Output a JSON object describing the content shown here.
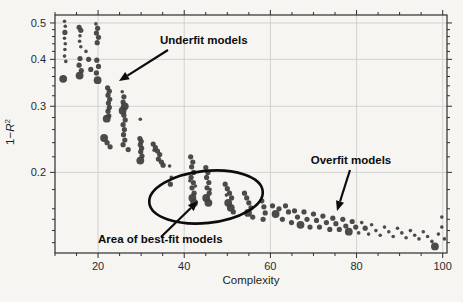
{
  "figure": {
    "bg_color": "#f6f5f2",
    "point_color": "#414140",
    "grid_color": "#c9c9c7",
    "frame_color": "#2e2e2e",
    "annotation_color": "#0c0c0c"
  },
  "chart_data": {
    "type": "scatter",
    "title": "",
    "xlabel": "Complexity",
    "ylabel": "1−R²",
    "ylabel_parts": {
      "prefix": "1−",
      "variable": "R",
      "superscript": "2"
    },
    "y_scale": "log",
    "grid": true,
    "xlim": [
      10,
      101
    ],
    "ylim": [
      0.122,
      0.525
    ],
    "x_ticks": [
      20,
      40,
      60,
      80,
      100
    ],
    "x_tick_labels": [
      "20",
      "40",
      "60",
      "80",
      "100"
    ],
    "x_minor_step": 5,
    "y_ticks": [
      0.5,
      0.4,
      0.3,
      0.2
    ],
    "y_tick_labels": [
      "0.5",
      "0.4",
      "0.3",
      "0.2"
    ],
    "y_minor_ticks": [
      0.48,
      0.46,
      0.44,
      0.42,
      0.38,
      0.36,
      0.34,
      0.32,
      0.28,
      0.26,
      0.24,
      0.22,
      0.18,
      0.16,
      0.15,
      0.14,
      0.13
    ],
    "points": [
      [
        12.2,
        0.505,
        "s"
      ],
      [
        12.4,
        0.49,
        "s"
      ],
      [
        12.3,
        0.472,
        "m"
      ],
      [
        12.2,
        0.455,
        "s"
      ],
      [
        12.4,
        0.44,
        "s"
      ],
      [
        12.3,
        0.425,
        "s"
      ],
      [
        12.2,
        0.408,
        "s"
      ],
      [
        12.5,
        0.395,
        "s"
      ],
      [
        11.9,
        0.355,
        "l"
      ],
      [
        15.6,
        0.487,
        "m"
      ],
      [
        16.0,
        0.478,
        "m"
      ],
      [
        15.8,
        0.462,
        "s"
      ],
      [
        15.7,
        0.447,
        "s"
      ],
      [
        16.0,
        0.432,
        "s"
      ],
      [
        15.8,
        0.402,
        "m"
      ],
      [
        15.6,
        0.386,
        "m"
      ],
      [
        16.1,
        0.373,
        "m"
      ],
      [
        15.7,
        0.362,
        "l"
      ],
      [
        17.2,
        0.42,
        "s"
      ],
      [
        17.8,
        0.4,
        "m"
      ],
      [
        18.3,
        0.376,
        "m"
      ],
      [
        19.5,
        0.497,
        "s"
      ],
      [
        19.9,
        0.484,
        "m"
      ],
      [
        19.6,
        0.47,
        "m"
      ],
      [
        20.1,
        0.458,
        "m"
      ],
      [
        19.8,
        0.443,
        "m"
      ],
      [
        19.7,
        0.398,
        "m"
      ],
      [
        20.1,
        0.383,
        "m"
      ],
      [
        19.6,
        0.368,
        "m"
      ],
      [
        19.9,
        0.352,
        "l"
      ],
      [
        22.2,
        0.336,
        "m"
      ],
      [
        22.6,
        0.329,
        "m"
      ],
      [
        22.3,
        0.321,
        "m"
      ],
      [
        22.7,
        0.313,
        "m"
      ],
      [
        22.4,
        0.306,
        "m"
      ],
      [
        22.6,
        0.298,
        "m"
      ],
      [
        22.3,
        0.291,
        "m"
      ],
      [
        22.5,
        0.283,
        "m"
      ],
      [
        22.0,
        0.278,
        "l"
      ],
      [
        21.4,
        0.247,
        "l"
      ],
      [
        22.1,
        0.24,
        "m"
      ],
      [
        22.8,
        0.234,
        "m"
      ],
      [
        25.6,
        0.328,
        "s"
      ],
      [
        26.0,
        0.318,
        "m"
      ],
      [
        25.8,
        0.308,
        "m"
      ],
      [
        26.2,
        0.3,
        "l"
      ],
      [
        25.7,
        0.292,
        "l"
      ],
      [
        26.0,
        0.284,
        "m"
      ],
      [
        26.3,
        0.276,
        "m"
      ],
      [
        25.8,
        0.268,
        "m"
      ],
      [
        26.1,
        0.26,
        "m"
      ],
      [
        25.9,
        0.252,
        "m"
      ],
      [
        26.2,
        0.244,
        "m"
      ],
      [
        25.8,
        0.237,
        "m"
      ],
      [
        27.0,
        0.23,
        "m"
      ],
      [
        29.8,
        0.277,
        "s"
      ],
      [
        29.7,
        0.246,
        "m"
      ],
      [
        30.0,
        0.242,
        "m"
      ],
      [
        29.8,
        0.237,
        "m"
      ],
      [
        30.1,
        0.232,
        "m"
      ],
      [
        29.9,
        0.227,
        "m"
      ],
      [
        30.2,
        0.221,
        "m"
      ],
      [
        29.8,
        0.215,
        "l"
      ],
      [
        32.8,
        0.238,
        "m"
      ],
      [
        33.3,
        0.233,
        "m"
      ],
      [
        33.8,
        0.228,
        "m"
      ],
      [
        34.3,
        0.223,
        "m"
      ],
      [
        33.0,
        0.229,
        "s"
      ],
      [
        34.0,
        0.217,
        "m"
      ],
      [
        34.7,
        0.213,
        "m"
      ],
      [
        35.1,
        0.209,
        "m"
      ],
      [
        36.6,
        0.208,
        "s"
      ],
      [
        37.0,
        0.194,
        "s"
      ],
      [
        36.8,
        0.186,
        "m"
      ],
      [
        41.5,
        0.22,
        "m"
      ],
      [
        42.0,
        0.213,
        "m"
      ],
      [
        41.7,
        0.207,
        "m"
      ],
      [
        42.2,
        0.2,
        "m"
      ],
      [
        41.6,
        0.194,
        "m"
      ],
      [
        42.1,
        0.188,
        "m"
      ],
      [
        41.8,
        0.182,
        "m"
      ],
      [
        42.3,
        0.176,
        "m"
      ],
      [
        41.9,
        0.171,
        "l"
      ],
      [
        42.3,
        0.166,
        "l"
      ],
      [
        41.3,
        0.19,
        "s"
      ],
      [
        42.6,
        0.184,
        "s"
      ],
      [
        45.0,
        0.206,
        "m"
      ],
      [
        45.5,
        0.2,
        "m"
      ],
      [
        45.2,
        0.194,
        "m"
      ],
      [
        45.7,
        0.188,
        "m"
      ],
      [
        45.3,
        0.182,
        "m"
      ],
      [
        45.8,
        0.176,
        "m"
      ],
      [
        45.1,
        0.171,
        "l"
      ],
      [
        45.6,
        0.166,
        "l"
      ],
      [
        46.0,
        0.18,
        "s"
      ],
      [
        49.5,
        0.186,
        "m"
      ],
      [
        50.0,
        0.181,
        "m"
      ],
      [
        50.5,
        0.176,
        "m"
      ],
      [
        51.0,
        0.171,
        "m"
      ],
      [
        50.2,
        0.166,
        "l"
      ],
      [
        50.8,
        0.161,
        "l"
      ],
      [
        51.4,
        0.157,
        "m"
      ],
      [
        49.8,
        0.174,
        "s"
      ],
      [
        54.0,
        0.176,
        "m"
      ],
      [
        54.5,
        0.171,
        "m"
      ],
      [
        55.0,
        0.166,
        "m"
      ],
      [
        55.5,
        0.161,
        "m"
      ],
      [
        54.8,
        0.156,
        "l"
      ],
      [
        55.9,
        0.152,
        "m"
      ],
      [
        58.0,
        0.168,
        "m"
      ],
      [
        58.5,
        0.162,
        "m"
      ],
      [
        58.8,
        0.156,
        "m"
      ],
      [
        58.3,
        0.15,
        "m"
      ],
      [
        60.5,
        0.163,
        "m"
      ],
      [
        61.2,
        0.155,
        "l"
      ],
      [
        62.0,
        0.16,
        "m"
      ],
      [
        62.8,
        0.15,
        "m"
      ],
      [
        63.5,
        0.163,
        "m"
      ],
      [
        64.2,
        0.157,
        "m"
      ],
      [
        64.9,
        0.147,
        "m"
      ],
      [
        65.6,
        0.158,
        "m"
      ],
      [
        66.3,
        0.152,
        "m"
      ],
      [
        67.0,
        0.145,
        "l"
      ],
      [
        67.8,
        0.157,
        "m"
      ],
      [
        68.5,
        0.15,
        "m"
      ],
      [
        69.2,
        0.143,
        "m"
      ],
      [
        70.0,
        0.155,
        "m"
      ],
      [
        70.7,
        0.149,
        "m"
      ],
      [
        71.4,
        0.143,
        "m"
      ],
      [
        72.2,
        0.153,
        "m"
      ],
      [
        73.0,
        0.147,
        "m"
      ],
      [
        73.8,
        0.141,
        "m"
      ],
      [
        74.5,
        0.151,
        "m"
      ],
      [
        75.2,
        0.146,
        "m"
      ],
      [
        76.0,
        0.141,
        "m"
      ],
      [
        76.8,
        0.15,
        "m"
      ],
      [
        77.5,
        0.144,
        "m"
      ],
      [
        78.2,
        0.139,
        "l"
      ],
      [
        79.0,
        0.148,
        "m"
      ],
      [
        79.8,
        0.143,
        "m"
      ],
      [
        80.5,
        0.138,
        "s"
      ],
      [
        81.2,
        0.147,
        "s"
      ],
      [
        82.0,
        0.142,
        "m"
      ],
      [
        82.8,
        0.137,
        "s"
      ],
      [
        83.5,
        0.145,
        "s"
      ],
      [
        84.5,
        0.14,
        "s"
      ],
      [
        85.5,
        0.136,
        "s"
      ],
      [
        86.5,
        0.143,
        "s"
      ],
      [
        87.5,
        0.139,
        "s"
      ],
      [
        88.5,
        0.135,
        "s"
      ],
      [
        89.5,
        0.142,
        "s"
      ],
      [
        90.5,
        0.138,
        "s"
      ],
      [
        91.5,
        0.134,
        "s"
      ],
      [
        92.5,
        0.14,
        "s"
      ],
      [
        93.5,
        0.136,
        "s"
      ],
      [
        94.5,
        0.133,
        "s"
      ],
      [
        95.5,
        0.139,
        "s"
      ],
      [
        96.5,
        0.135,
        "s"
      ],
      [
        97.5,
        0.131,
        "s"
      ],
      [
        98.2,
        0.127,
        "l"
      ],
      [
        99.0,
        0.137,
        "s"
      ],
      [
        99.8,
        0.152,
        "s"
      ],
      [
        99.8,
        0.143,
        "s"
      ],
      [
        100.4,
        0.133,
        "s"
      ]
    ],
    "annotations": [
      {
        "id": "underfit",
        "label": "Underfit models",
        "text_x": 160,
        "text_y": 44,
        "anchor": "start",
        "arrow": [
          168,
          50,
          119,
          81
        ]
      },
      {
        "id": "overfit",
        "label": "Overfit models",
        "text_x": 351,
        "text_y": 164,
        "anchor": "middle",
        "arrow": [
          350,
          170,
          337,
          211
        ]
      },
      {
        "id": "bestfit",
        "label": "Area of best-fit models",
        "text_x": 98,
        "text_y": 243,
        "anchor": "start",
        "arrow": [
          161,
          237,
          198,
          201
        ]
      }
    ],
    "ellipse": {
      "cx": 206,
      "cy": 197,
      "rx": 57,
      "ry": 26,
      "rotate": -6
    },
    "legend": null
  }
}
